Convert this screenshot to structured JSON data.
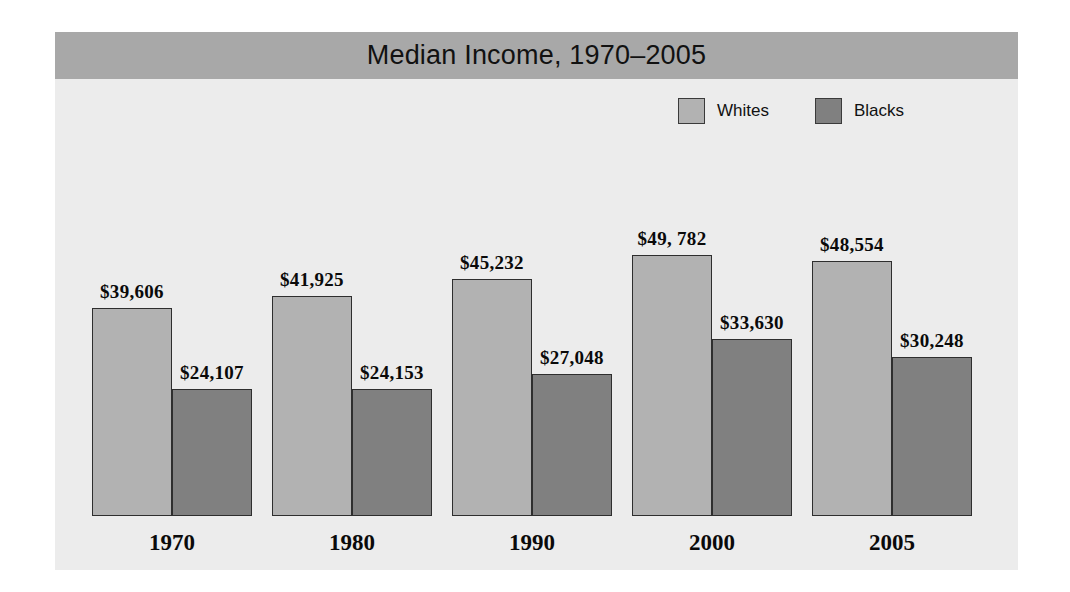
{
  "chart_data": {
    "type": "bar",
    "title": "Median Income, 1970–2005",
    "xlabel": "",
    "ylabel": "",
    "categories": [
      "1970",
      "1980",
      "1990",
      "2000",
      "2005"
    ],
    "series": [
      {
        "name": "Whites",
        "color": "#b2b2b2",
        "values": [
          39606,
          41925,
          45232,
          49782,
          48554
        ],
        "labels": [
          "$39,606",
          "$41,925",
          "$45,232",
          "$49, 782",
          "$48,554"
        ]
      },
      {
        "name": "Blacks",
        "color": "#808080",
        "values": [
          24107,
          24153,
          27048,
          33630,
          30248
        ],
        "labels": [
          "$24,107",
          "$24,153",
          "$27,048",
          "$33,630",
          "$30,248"
        ]
      }
    ],
    "ylim": [
      0,
      56000
    ],
    "grid": false,
    "legend_position": "top-right"
  },
  "legend": {
    "items": [
      {
        "label": "Whites",
        "color": "#b2b2b2"
      },
      {
        "label": "Blacks",
        "color": "#808080"
      }
    ]
  },
  "colors": {
    "title_band": "#a8a8a8",
    "panel_background": "#ececec",
    "bar_outline": "#2e2e2e",
    "whites": "#b2b2b2",
    "blacks": "#808080"
  }
}
